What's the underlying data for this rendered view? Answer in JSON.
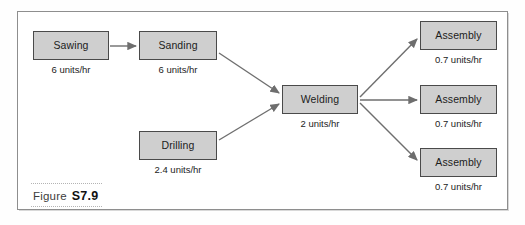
{
  "figure": {
    "caption_word": "Figure",
    "caption_number": "S7.9",
    "frame_color": "#8e8e8e",
    "background_color": "#ffffff"
  },
  "style": {
    "node_fill": "#cfcfcf",
    "node_border": "#4a4a4a",
    "connector_color": "#6e6e6e",
    "text_color": "#1c1c1c"
  },
  "nodes": [
    {
      "id": "sawing",
      "label": "Sawing",
      "rate": "6 units/hr",
      "x": 33,
      "y": 31,
      "w": 76,
      "h": 29,
      "rate_x": 33,
      "rate_y": 65,
      "rate_w": 76
    },
    {
      "id": "sanding",
      "label": "Sanding",
      "rate": "6 units/hr",
      "x": 139,
      "y": 31,
      "w": 78,
      "h": 29,
      "rate_x": 139,
      "rate_y": 65,
      "rate_w": 78
    },
    {
      "id": "drilling",
      "label": "Drilling",
      "rate": "2.4 units/hr",
      "x": 139,
      "y": 131,
      "w": 78,
      "h": 29,
      "rate_x": 136,
      "rate_y": 165,
      "rate_w": 84
    },
    {
      "id": "welding",
      "label": "Welding",
      "rate": "2 units/hr",
      "x": 282,
      "y": 85,
      "w": 76,
      "h": 29,
      "rate_x": 282,
      "rate_y": 119,
      "rate_w": 76
    },
    {
      "id": "assembly-1",
      "label": "Assembly",
      "rate": "0.7 units/hr",
      "x": 420,
      "y": 21,
      "w": 77,
      "h": 29,
      "rate_x": 417,
      "rate_y": 55,
      "rate_w": 83
    },
    {
      "id": "assembly-2",
      "label": "Assembly",
      "rate": "0.7 units/hr",
      "x": 420,
      "y": 85,
      "w": 77,
      "h": 29,
      "rate_x": 417,
      "rate_y": 119,
      "rate_w": 83
    },
    {
      "id": "assembly-3",
      "label": "Assembly",
      "rate": "0.7 units/hr",
      "x": 420,
      "y": 148,
      "w": 77,
      "h": 29,
      "rate_x": 417,
      "rate_y": 182,
      "rate_w": 83
    }
  ],
  "connectors": [
    {
      "id": "sawing-to-sanding",
      "from": "sawing",
      "to": "sanding",
      "x1": 110,
      "y1": 46,
      "x2": 136,
      "y2": 46
    },
    {
      "id": "sanding-to-welding",
      "from": "sanding",
      "to": "welding",
      "x1": 219,
      "y1": 53,
      "x2": 279,
      "y2": 93
    },
    {
      "id": "drilling-to-welding",
      "from": "drilling",
      "to": "welding",
      "x1": 219,
      "y1": 140,
      "x2": 279,
      "y2": 104
    },
    {
      "id": "welding-to-assembly-1",
      "from": "welding",
      "to": "assembly-1",
      "x1": 360,
      "y1": 97,
      "x2": 417,
      "y2": 39
    },
    {
      "id": "welding-to-assembly-2",
      "from": "welding",
      "to": "assembly-2",
      "x1": 360,
      "y1": 100,
      "x2": 417,
      "y2": 100
    },
    {
      "id": "welding-to-assembly-3",
      "from": "welding",
      "to": "assembly-3",
      "x1": 360,
      "y1": 103,
      "x2": 417,
      "y2": 160
    }
  ]
}
